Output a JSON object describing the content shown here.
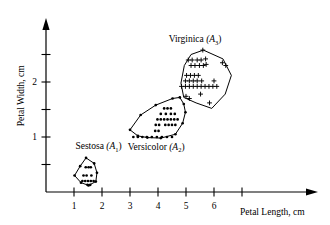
{
  "chart_data": {
    "type": "scatter",
    "title": "",
    "xlabel": "Petal Length, cm",
    "ylabel": "Petal Width, cm",
    "xlim": [
      0,
      7.6
    ],
    "ylim": [
      0,
      2.85
    ],
    "grid": false,
    "legend_position": "inline-annotations",
    "xticks": [
      1,
      2,
      3,
      4,
      5,
      6,
      7
    ],
    "xtick_labels": [
      "1",
      "2",
      "3",
      "4",
      "5",
      "6",
      ""
    ],
    "yticks": [
      0.5,
      1.0,
      1.5,
      2.0,
      2.5
    ],
    "ytick_labels": [
      "",
      "1",
      "",
      "2",
      ""
    ],
    "annotations": [
      {
        "name": "setosa-label",
        "text": "Sestosa",
        "sub": "(A",
        "subscript": "1",
        "close": ")",
        "x": 1.05,
        "y": 0.78
      },
      {
        "name": "versicolor-label",
        "text": "Versicolor",
        "sub": "(A",
        "subscript": "2",
        "close": ")",
        "x": 2.92,
        "y": 0.77
      },
      {
        "name": "virginica-label",
        "text": "Virginica",
        "sub": "(A",
        "subscript": "3",
        "close": ")",
        "x": 4.38,
        "y": 2.72
      }
    ],
    "series": [
      {
        "name": "Sestosa (A1)",
        "marker": "dot",
        "hull": [
          [
            1.43,
            0.62
          ],
          [
            1.72,
            0.52
          ],
          [
            1.82,
            0.35
          ],
          [
            1.78,
            0.19
          ],
          [
            1.52,
            0.12
          ],
          [
            1.25,
            0.17
          ],
          [
            1.02,
            0.3
          ],
          [
            1.22,
            0.47
          ]
        ],
        "points": [
          [
            1.42,
            0.45
          ],
          [
            1.52,
            0.45
          ],
          [
            1.6,
            0.45
          ],
          [
            1.34,
            0.3
          ],
          [
            1.45,
            0.3
          ],
          [
            1.62,
            0.3
          ],
          [
            1.3,
            0.2
          ],
          [
            1.4,
            0.2
          ],
          [
            1.5,
            0.2
          ],
          [
            1.6,
            0.2
          ],
          [
            1.7,
            0.2
          ],
          [
            1.48,
            0.13
          ],
          [
            1.58,
            0.13
          ]
        ]
      },
      {
        "name": "Versicolor (A2)",
        "marker": "dot",
        "hull": [
          [
            4.52,
            1.7
          ],
          [
            4.78,
            1.72
          ],
          [
            4.92,
            1.6
          ],
          [
            4.98,
            1.45
          ],
          [
            4.88,
            1.25
          ],
          [
            4.62,
            1.05
          ],
          [
            4.1,
            0.98
          ],
          [
            3.62,
            0.99
          ],
          [
            3.28,
            1.02
          ],
          [
            3.0,
            1.13
          ],
          [
            3.38,
            1.4
          ],
          [
            3.92,
            1.58
          ]
        ],
        "points": [
          [
            4.22,
            1.52
          ],
          [
            4.34,
            1.52
          ],
          [
            4.46,
            1.52
          ],
          [
            4.1,
            1.42
          ],
          [
            4.28,
            1.42
          ],
          [
            4.46,
            1.42
          ],
          [
            4.6,
            1.42
          ],
          [
            3.98,
            1.32
          ],
          [
            4.1,
            1.32
          ],
          [
            4.22,
            1.32
          ],
          [
            4.34,
            1.32
          ],
          [
            4.46,
            1.32
          ],
          [
            4.58,
            1.32
          ],
          [
            4.7,
            1.32
          ],
          [
            3.92,
            1.22
          ],
          [
            4.04,
            1.22
          ],
          [
            4.26,
            1.22
          ],
          [
            4.38,
            1.22
          ],
          [
            4.5,
            1.22
          ],
          [
            4.62,
            1.22
          ],
          [
            3.9,
            1.11
          ],
          [
            4.02,
            1.11
          ],
          [
            3.12,
            1.0
          ],
          [
            3.28,
            1.0
          ],
          [
            3.44,
            1.0
          ],
          [
            3.6,
            1.0
          ],
          [
            3.78,
            1.0
          ],
          [
            3.96,
            1.0
          ],
          [
            4.14,
            1.0
          ],
          [
            4.32,
            1.0
          ],
          [
            4.5,
            1.0
          ]
        ]
      },
      {
        "name": "Virginica (A3)",
        "marker": "plus",
        "hull": [
          [
            5.62,
            2.58
          ],
          [
            6.32,
            2.42
          ],
          [
            6.62,
            2.12
          ],
          [
            6.4,
            1.78
          ],
          [
            5.92,
            1.52
          ],
          [
            5.36,
            1.62
          ],
          [
            4.92,
            1.72
          ],
          [
            4.82,
            1.98
          ],
          [
            4.94,
            2.3
          ],
          [
            5.18,
            2.5
          ]
        ],
        "points": [
          [
            5.6,
            2.58
          ],
          [
            5.08,
            2.4
          ],
          [
            5.22,
            2.4
          ],
          [
            5.4,
            2.4
          ],
          [
            5.54,
            2.4
          ],
          [
            5.7,
            2.42
          ],
          [
            5.18,
            2.3
          ],
          [
            5.32,
            2.3
          ],
          [
            5.48,
            2.3
          ],
          [
            5.62,
            2.3
          ],
          [
            5.72,
            2.32
          ],
          [
            6.3,
            2.35
          ],
          [
            6.42,
            2.3
          ],
          [
            5.02,
            2.12
          ],
          [
            5.16,
            2.12
          ],
          [
            5.3,
            2.12
          ],
          [
            5.44,
            2.12
          ],
          [
            4.98,
            2.02
          ],
          [
            5.12,
            2.02
          ],
          [
            5.26,
            2.02
          ],
          [
            5.4,
            2.02
          ],
          [
            5.56,
            2.02
          ],
          [
            6.0,
            2.02
          ],
          [
            4.84,
            1.92
          ],
          [
            4.98,
            1.92
          ],
          [
            5.12,
            1.92
          ],
          [
            5.26,
            1.92
          ],
          [
            5.4,
            1.92
          ],
          [
            5.54,
            1.92
          ],
          [
            5.68,
            1.92
          ],
          [
            5.82,
            1.92
          ],
          [
            5.96,
            1.92
          ],
          [
            6.1,
            1.92
          ],
          [
            5.52,
            1.78
          ],
          [
            5.0,
            1.74
          ],
          [
            5.12,
            1.7
          ],
          [
            5.84,
            1.62
          ]
        ]
      }
    ]
  },
  "axes": {
    "x_title": "Petal Length, cm",
    "y_title": "Petal Width, cm"
  }
}
